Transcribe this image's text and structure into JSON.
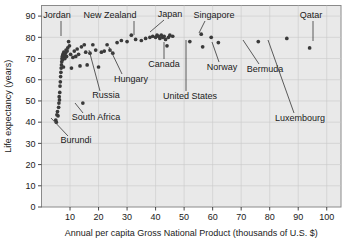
{
  "chart_data": {
    "type": "scatter",
    "title": "",
    "xlabel": "Annual per capita Gross National Product (thousands of U.S. $)",
    "ylabel": "Life expectancy (years)",
    "xlim": [
      0,
      105
    ],
    "ylim": [
      0,
      95
    ],
    "xticks": [
      10,
      20,
      30,
      40,
      50,
      60,
      70,
      80,
      90,
      100
    ],
    "yticks": [
      0,
      10,
      20,
      30,
      40,
      50,
      60,
      70,
      80,
      90
    ],
    "grid": true,
    "legend": "none",
    "x": [
      5.0,
      5.2,
      5.4,
      5.6,
      5.8,
      6.0,
      6.1,
      6.2,
      6.3,
      6.4,
      6.5,
      6.6,
      6.7,
      6.8,
      6.9,
      7.0,
      7.1,
      7.2,
      7.3,
      7.4,
      7.5,
      7.6,
      7.7,
      7.8,
      8.0,
      8.2,
      8.4,
      8.6,
      8.8,
      9.0,
      9.2,
      9.5,
      9.8,
      10.2,
      10.5,
      11.0,
      11.5,
      12.0,
      12.5,
      13.0,
      13.5,
      14.0,
      14.5,
      15.0,
      15.5,
      16.0,
      17.0,
      18.0,
      19.0,
      20.0,
      21.0,
      22.0,
      23.0,
      24.0,
      25.0,
      26.5,
      28.0,
      30.0,
      31.5,
      33.0,
      35.0,
      36.5,
      38.0,
      39.0,
      40.0,
      40.5,
      41.0,
      41.5,
      42.0,
      42.5,
      43.0,
      43.5,
      44.0,
      44.5,
      45.0,
      46.0,
      52.0,
      56.0,
      56.5,
      59.5,
      62.0,
      76.0,
      86.0,
      94.0
    ],
    "y": [
      41.0,
      40.0,
      43.5,
      45.0,
      43.0,
      47.0,
      49.0,
      52.0,
      50.5,
      54.0,
      57.0,
      59.0,
      61.5,
      63.5,
      65.5,
      67.0,
      68.5,
      70.0,
      71.0,
      69.5,
      72.0,
      70.5,
      66.0,
      73.0,
      71.5,
      70.0,
      72.5,
      74.0,
      71.0,
      73.5,
      75.0,
      78.0,
      76.0,
      72.0,
      65.5,
      70.5,
      73.5,
      71.0,
      74.5,
      72.0,
      66.5,
      75.5,
      49.0,
      76.5,
      73.0,
      67.0,
      72.5,
      76.5,
      74.0,
      66.0,
      73.0,
      73.5,
      76.5,
      74.0,
      72.5,
      77.5,
      78.5,
      78.0,
      81.0,
      79.0,
      78.5,
      79.5,
      80.0,
      80.5,
      80.0,
      81.0,
      80.5,
      79.5,
      81.0,
      80.0,
      80.5,
      79.0,
      76.0,
      80.0,
      81.0,
      80.5,
      78.0,
      81.5,
      75.5,
      80.0,
      77.5,
      78.0,
      79.5,
      75.0
    ],
    "annotations": [
      {
        "label": "Jordan",
        "text_x": 57,
        "text_y": 18,
        "anchor": "middle",
        "line": [
          [
            61,
            21
          ],
          [
            61,
            36
          ]
        ]
      },
      {
        "label": "New Zealand",
        "text_x": 110,
        "text_y": 18,
        "anchor": "middle",
        "line": [
          [
            134,
            21
          ],
          [
            134,
            35
          ]
        ]
      },
      {
        "label": "Japan",
        "text_x": 170,
        "text_y": 17,
        "anchor": "middle",
        "line": [
          [
            164,
            20
          ],
          [
            150,
            32
          ]
        ]
      },
      {
        "label": "Singapore",
        "text_x": 214,
        "text_y": 18,
        "anchor": "middle",
        "line": [
          [
            205,
            21
          ],
          [
            199,
            33
          ]
        ]
      },
      {
        "label": "Qatar",
        "text_x": 311,
        "text_y": 18,
        "anchor": "middle",
        "line": [
          [
            313,
            21
          ],
          [
            313,
            41
          ]
        ]
      },
      {
        "label": "Canada",
        "text_x": 164,
        "text_y": 67,
        "anchor": "middle",
        "line": [
          [
            164,
            59
          ],
          [
            164,
            42
          ]
        ]
      },
      {
        "label": "Norway",
        "text_x": 222,
        "text_y": 70,
        "anchor": "middle",
        "line": [
          [
            219,
            62
          ],
          [
            212,
            42
          ]
        ]
      },
      {
        "label": "Bermuda",
        "text_x": 265,
        "text_y": 72,
        "anchor": "middle",
        "line": [
          [
            259,
            64
          ],
          [
            243,
            40
          ]
        ]
      },
      {
        "label": "United States",
        "text_x": 190,
        "text_y": 99,
        "anchor": "middle",
        "line": [
          [
            186,
            91
          ],
          [
            186,
            40
          ]
        ]
      },
      {
        "label": "Hungary",
        "text_x": 131,
        "text_y": 82,
        "anchor": "middle",
        "line": [
          [
            122,
            74
          ],
          [
            109,
            47
          ]
        ]
      },
      {
        "label": "Russia",
        "text_x": 106,
        "text_y": 98,
        "anchor": "middle",
        "line": [
          [
            100,
            91
          ],
          [
            89,
            50
          ]
        ]
      },
      {
        "label": "South Africa",
        "text_x": 96,
        "text_y": 120,
        "anchor": "middle",
        "line": [
          [
            83,
            113
          ],
          [
            75,
            103
          ]
        ]
      },
      {
        "label": "Burundi",
        "text_x": 76,
        "text_y": 143,
        "anchor": "middle",
        "line": [
          [
            68,
            136
          ],
          [
            51,
            118
          ]
        ]
      },
      {
        "label": "Luxembourg",
        "text_x": 300,
        "text_y": 121,
        "anchor": "middle",
        "line": [
          [
            294,
            113
          ],
          [
            268,
            40
          ]
        ]
      }
    ]
  },
  "axes": {
    "x_title": "Annual per capita Gross National Product (thousands of U.S. $)",
    "y_title": "Life expectancy (years)"
  }
}
